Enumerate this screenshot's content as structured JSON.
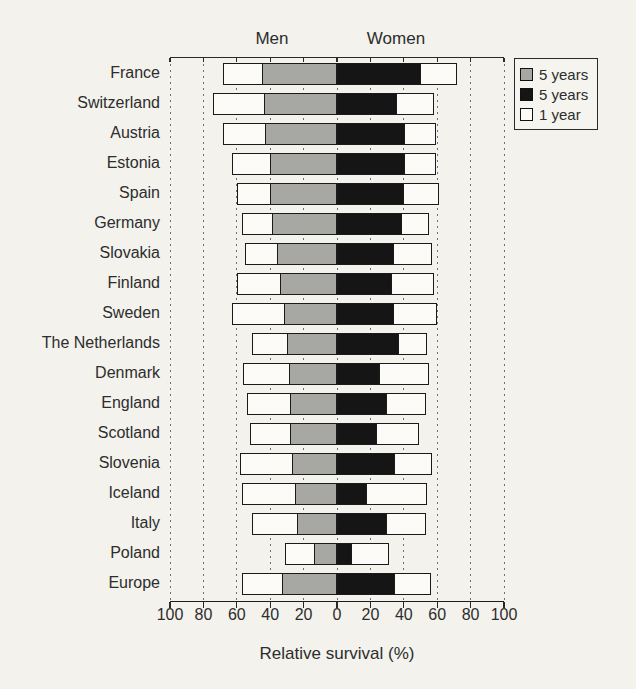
{
  "colors": {
    "paper": "#f3f2ec",
    "bar_gray": "#a7a7a3",
    "bar_black": "#151515",
    "bar_white": "#fcfbf7",
    "bar_border": "#1a1a1a",
    "grid": "#6f6f6f",
    "text": "#2d2d2d"
  },
  "chart_data": {
    "type": "bar",
    "subtype": "diverging-horizontal-stacked",
    "group_labels": {
      "left": "Men",
      "right": "Women"
    },
    "xlabel": "Relative survival (%)",
    "x_ticks": [
      "100",
      "80",
      "60",
      "40",
      "20",
      "0",
      "20",
      "40",
      "60",
      "80",
      "100"
    ],
    "x_range_each_side": [
      0,
      100
    ],
    "grid": "dashed-vertical-every-20",
    "legend_position": "top-right",
    "legend": [
      {
        "label": "5 years",
        "color_key": "bar_gray"
      },
      {
        "label": "5 years",
        "color_key": "bar_black"
      },
      {
        "label": "1 year",
        "color_key": "bar_white"
      }
    ],
    "categories": [
      "France",
      "Switzerland",
      "Austria",
      "Estonia",
      "Spain",
      "Germany",
      "Slovakia",
      "Finland",
      "Sweden",
      "The Netherlands",
      "Denmark",
      "England",
      "Scotland",
      "Slovenia",
      "Iceland",
      "Italy",
      "Poland",
      "Europe"
    ],
    "series": [
      {
        "name": "Men 5 years",
        "side": "men",
        "color_key": "bar_gray",
        "values": [
          45,
          44,
          43,
          40,
          40,
          39,
          36,
          34,
          32,
          30,
          29,
          28,
          28,
          27,
          25,
          24,
          14,
          33
        ]
      },
      {
        "name": "Men 1 year",
        "side": "men",
        "color_key": "bar_white",
        "values": [
          68,
          74,
          68,
          63,
          60,
          57,
          55,
          60,
          63,
          51,
          56,
          54,
          52,
          58,
          57,
          51,
          31,
          57
        ]
      },
      {
        "name": "Women 5 years",
        "side": "women",
        "color_key": "bar_black",
        "values": [
          50,
          36,
          41,
          41,
          40,
          39,
          34,
          33,
          34,
          37,
          26,
          30,
          24,
          35,
          18,
          30,
          9,
          35
        ]
      },
      {
        "name": "Women 1 year",
        "side": "women",
        "color_key": "bar_white",
        "values": [
          72,
          58,
          59,
          59,
          61,
          55,
          57,
          58,
          60,
          54,
          55,
          53,
          49,
          57,
          54,
          53,
          31,
          56
        ]
      }
    ]
  }
}
